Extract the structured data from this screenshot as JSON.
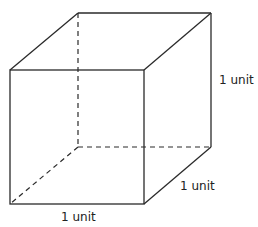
{
  "diagram": {
    "type": "cube",
    "stroke_color": "#2a2a2a",
    "labels": {
      "height": "1 unit",
      "depth": "1 unit",
      "width": "1 unit"
    }
  }
}
